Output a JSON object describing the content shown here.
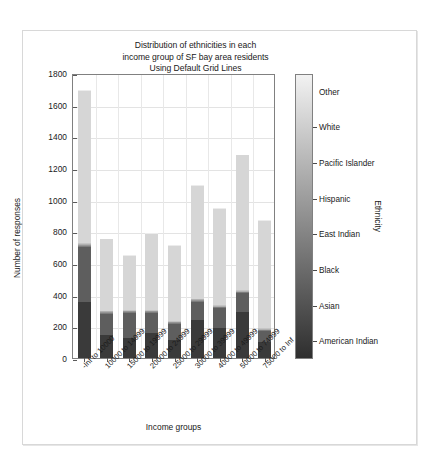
{
  "figure": {
    "title_lines": [
      "Distribution of ethnicities in each",
      "income group of SF bay area residents",
      "Using Default Grid Lines"
    ],
    "background_color": "#ffffff",
    "border_color": "#d8d8d8"
  },
  "chart_data": {
    "type": "bar",
    "stacked": true,
    "title": "Distribution of ethnicities in each income group of SF bay area residents Using Default Grid Lines",
    "xlabel": "Income groups",
    "ylabel": "Number of responses",
    "ylim": [
      0,
      1800
    ],
    "yticks": [
      0,
      200,
      400,
      600,
      800,
      1000,
      1200,
      1400,
      1600,
      1800
    ],
    "ytick_labels": [
      "0",
      "200",
      "400",
      "600",
      "800",
      "1000",
      "1200",
      "1400",
      "1600",
      "1800"
    ],
    "grid": true,
    "legend_position": "right-colorbar",
    "legend_title": "Ethnicity",
    "categories": [
      "-Inf to 10000",
      "10000 to 14999",
      "15000 to 19999",
      "20000 to 24999",
      "25000 to 29999",
      "30000 to 39999",
      "40000 to 49999",
      "50000 to 74999",
      "75000 to  Inf"
    ],
    "series": [
      {
        "name": "American Indian",
        "color": "#3a3a3a",
        "values": [
          355,
          145,
          125,
          160,
          115,
          240,
          190,
          290,
          100
        ]
      },
      {
        "name": "Asian",
        "color": "#5e5e5e",
        "values": [
          345,
          135,
          160,
          125,
          100,
          115,
          125,
          120,
          70
        ]
      },
      {
        "name": "Black",
        "color": "#7d7d7d",
        "values": [
          10,
          5,
          5,
          5,
          5,
          5,
          5,
          5,
          5
        ]
      },
      {
        "name": "East Indian",
        "color": "#969696",
        "values": [
          5,
          5,
          5,
          5,
          5,
          5,
          5,
          5,
          5
        ]
      },
      {
        "name": "Hispanic",
        "color": "#b0b0b0",
        "values": [
          5,
          5,
          5,
          5,
          5,
          5,
          5,
          5,
          5
        ]
      },
      {
        "name": "Pacific Islander",
        "color": "#c4c4c4",
        "values": [
          5,
          5,
          5,
          5,
          5,
          5,
          5,
          5,
          5
        ]
      },
      {
        "name": "White",
        "color": "#d6d6d6",
        "values": [
          960,
          450,
          340,
          480,
          475,
          710,
          605,
          850,
          675
        ]
      },
      {
        "name": "Other",
        "color": "#ececec",
        "values": [
          5,
          5,
          5,
          5,
          5,
          5,
          5,
          5,
          5
        ]
      }
    ],
    "totals": [
      1690,
      750,
      645,
      785,
      710,
      1090,
      940,
      1280,
      865
    ],
    "colorbar": {
      "labels": [
        "Other",
        "White",
        "Pacific Islander",
        "Hispanic",
        "East Indian",
        "Black",
        "Asian",
        "American Indian"
      ],
      "top_color": "#f2f2f2",
      "bottom_color": "#2e2e2e"
    }
  }
}
